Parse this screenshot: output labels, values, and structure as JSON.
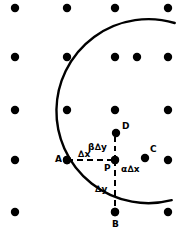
{
  "figure": {
    "width": 181,
    "height": 238,
    "background_color": "#ffffff",
    "ink_color": "#000000"
  },
  "grid": {
    "columns_x": [
      15,
      67,
      115,
      168
    ],
    "rows_y": [
      8,
      57,
      110,
      160,
      212
    ],
    "dot_radius": 4.2,
    "dot_color": "#000000",
    "omitted_nodes": [
      [
        67,
        212
      ]
    ]
  },
  "curve": {
    "type": "arc",
    "stroke_color": "#000000",
    "stroke_width": 2.4,
    "center_x": 198,
    "center_y": 112,
    "radius": 92,
    "opens": "right",
    "passes_through": [
      [
        115,
        110
      ],
      [
        116,
        133
      ],
      [
        145,
        158
      ],
      [
        137,
        57
      ]
    ],
    "leftmost_x": 106,
    "exit_top_right": [
      181,
      47
    ],
    "exit_bottom_right": [
      181,
      169
    ]
  },
  "dashed_lines": [
    {
      "name": "horizontal-A-to-P",
      "from": [
        67,
        160
      ],
      "to": [
        115,
        160
      ],
      "dash": "6,4",
      "width": 2
    },
    {
      "name": "vertical-P-to-B",
      "from": [
        115,
        160
      ],
      "to": [
        115,
        212
      ],
      "dash": "6,4",
      "width": 2
    },
    {
      "name": "vertical-P-to-D",
      "from": [
        115,
        160
      ],
      "to": [
        115,
        131
      ],
      "dash": "5,4",
      "width": 2
    }
  ],
  "points": [
    {
      "id": "A",
      "label": "A",
      "x": 67,
      "y": 160,
      "marker": true,
      "label_dx": -12,
      "label_dy": -5
    },
    {
      "id": "P",
      "label": "P",
      "x": 115,
      "y": 160,
      "marker": true,
      "label_dx": -11,
      "label_dy": 4
    },
    {
      "id": "B",
      "label": "B",
      "x": 115,
      "y": 212,
      "marker": true,
      "label_dx": -3,
      "label_dy": 8
    },
    {
      "id": "C",
      "label": "C",
      "x": 145,
      "y": 158,
      "marker": true,
      "label_dx": 5,
      "label_dy": -13
    },
    {
      "id": "D",
      "label": "D",
      "x": 116,
      "y": 133,
      "marker": true,
      "label_dx": 6,
      "label_dy": -11
    },
    {
      "id": "E",
      "label": "",
      "x": 137,
      "y": 57,
      "marker": true,
      "label_dx": 0,
      "label_dy": 0
    }
  ],
  "annotations": [
    {
      "id": "delta-x",
      "text": "∆x",
      "x": 78,
      "y": 150
    },
    {
      "id": "beta-delta-y",
      "text": "β∆y",
      "x": 88,
      "y": 143
    },
    {
      "id": "alpha-delta-x",
      "text": "α∆x",
      "x": 121,
      "y": 165
    },
    {
      "id": "delta-y",
      "text": "∆y",
      "x": 95,
      "y": 185
    }
  ]
}
